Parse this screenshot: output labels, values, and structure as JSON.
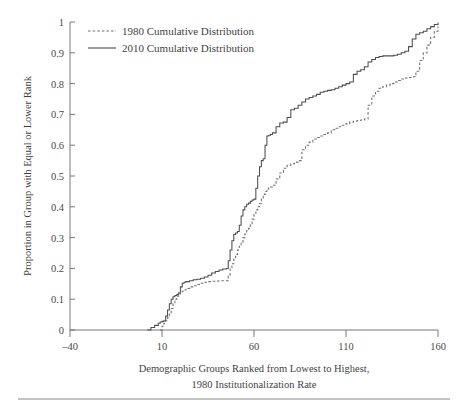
{
  "chart_data": {
    "type": "line",
    "title": "",
    "subtitle": "",
    "xlabel_line1": "Demographic Groups Ranked from Lowest to Highest,",
    "xlabel_line2": "1980 Institutionalization Rate",
    "ylabel": "Proportion in Group with Equal or Lower Rank",
    "xlim": [
      -40,
      160
    ],
    "ylim": [
      0,
      1
    ],
    "xticks": [
      -40,
      10,
      60,
      110,
      160
    ],
    "xticklabels": [
      "–40",
      "10",
      "60",
      "110",
      "160"
    ],
    "yticks": [
      0,
      0.1,
      0.2,
      0.3,
      0.4,
      0.5,
      0.6,
      0.7,
      0.8,
      0.9,
      1
    ],
    "yticklabels": [
      "0",
      "0.1",
      "0.2",
      "0.3",
      "0.4",
      "0.5",
      "0.6",
      "0.7",
      "0.8",
      "0.9",
      "1"
    ],
    "grid": false,
    "legend_position": "top-left-inside",
    "series": [
      {
        "name": "1980 Cumulative Distribution",
        "style": "dashed",
        "color": "#6f6f6f",
        "x": [
          9,
          10,
          11,
          12,
          13,
          14,
          15,
          16,
          17,
          18,
          19,
          20,
          21,
          22,
          23,
          25,
          27,
          29,
          31,
          33,
          35,
          37,
          39,
          41,
          43,
          45,
          46,
          47,
          48,
          49,
          50,
          51,
          52,
          53,
          54,
          55,
          56,
          57,
          58,
          59,
          60,
          61,
          62,
          63,
          64,
          65,
          66,
          67,
          68,
          69,
          70,
          72,
          74,
          76,
          78,
          80,
          82,
          84,
          86,
          88,
          90,
          92,
          94,
          96,
          98,
          100,
          102,
          104,
          106,
          108,
          110,
          112,
          114,
          116,
          118,
          120,
          122,
          124,
          126,
          128,
          130,
          132,
          134,
          136,
          138,
          140,
          142,
          144,
          146,
          148,
          150,
          152,
          154,
          156,
          158,
          160
        ],
        "y": [
          0,
          0.012,
          0.022,
          0.03,
          0.04,
          0.055,
          0.07,
          0.085,
          0.1,
          0.11,
          0.118,
          0.122,
          0.126,
          0.13,
          0.135,
          0.14,
          0.144,
          0.148,
          0.152,
          0.155,
          0.157,
          0.158,
          0.159,
          0.16,
          0.16,
          0.16,
          0.175,
          0.2,
          0.215,
          0.23,
          0.245,
          0.26,
          0.272,
          0.285,
          0.3,
          0.312,
          0.322,
          0.33,
          0.345,
          0.36,
          0.375,
          0.39,
          0.4,
          0.41,
          0.425,
          0.44,
          0.45,
          0.458,
          0.462,
          0.464,
          0.47,
          0.49,
          0.51,
          0.525,
          0.535,
          0.54,
          0.545,
          0.55,
          0.585,
          0.6,
          0.61,
          0.62,
          0.625,
          0.63,
          0.635,
          0.64,
          0.65,
          0.655,
          0.66,
          0.665,
          0.67,
          0.675,
          0.678,
          0.68,
          0.682,
          0.685,
          0.73,
          0.76,
          0.775,
          0.785,
          0.79,
          0.795,
          0.8,
          0.805,
          0.81,
          0.815,
          0.818,
          0.82,
          0.822,
          0.84,
          0.875,
          0.9,
          0.925,
          0.95,
          0.97,
          0.985
        ]
      },
      {
        "name": "2010 Cumulative Distribution",
        "style": "solid",
        "color": "#4d4d4d",
        "x": [
          2,
          4,
          6,
          8,
          9,
          10,
          11,
          12,
          13,
          14,
          15,
          16,
          17,
          18,
          19,
          20,
          21,
          22,
          23,
          25,
          27,
          29,
          31,
          33,
          35,
          37,
          39,
          41,
          43,
          45,
          46,
          47,
          48,
          49,
          50,
          51,
          52,
          53,
          54,
          55,
          56,
          57,
          58,
          59,
          60,
          61,
          62,
          63,
          64,
          65,
          66,
          67,
          68,
          69,
          70,
          72,
          74,
          76,
          78,
          80,
          82,
          84,
          86,
          88,
          90,
          92,
          94,
          96,
          98,
          100,
          102,
          104,
          106,
          108,
          110,
          112,
          114,
          116,
          118,
          120,
          122,
          124,
          126,
          128,
          130,
          132,
          134,
          136,
          138,
          140,
          142,
          144,
          146,
          148,
          150,
          152,
          154,
          156,
          158,
          160
        ],
        "y": [
          0,
          0.008,
          0.015,
          0.022,
          0.026,
          0.028,
          0.03,
          0.045,
          0.065,
          0.085,
          0.1,
          0.108,
          0.112,
          0.115,
          0.12,
          0.14,
          0.152,
          0.155,
          0.157,
          0.16,
          0.163,
          0.165,
          0.168,
          0.172,
          0.178,
          0.185,
          0.19,
          0.195,
          0.198,
          0.2,
          0.225,
          0.26,
          0.29,
          0.31,
          0.315,
          0.32,
          0.34,
          0.37,
          0.39,
          0.4,
          0.408,
          0.412,
          0.418,
          0.422,
          0.425,
          0.46,
          0.5,
          0.53,
          0.55,
          0.556,
          0.6,
          0.63,
          0.632,
          0.635,
          0.64,
          0.66,
          0.672,
          0.675,
          0.69,
          0.715,
          0.72,
          0.73,
          0.74,
          0.75,
          0.755,
          0.76,
          0.765,
          0.772,
          0.775,
          0.778,
          0.78,
          0.785,
          0.79,
          0.795,
          0.8,
          0.805,
          0.83,
          0.84,
          0.845,
          0.855,
          0.87,
          0.878,
          0.885,
          0.888,
          0.89,
          0.89,
          0.89,
          0.892,
          0.895,
          0.9,
          0.905,
          0.92,
          0.945,
          0.96,
          0.965,
          0.97,
          0.978,
          0.985,
          0.992,
          0.998
        ]
      }
    ]
  },
  "legend": {
    "items": [
      {
        "label": "1980 Cumulative Distribution",
        "style": "dashed"
      },
      {
        "label": "2010 Cumulative Distribution",
        "style": "solid"
      }
    ]
  },
  "axes": {
    "y_title": "Proportion in Group with Equal or Lower Rank",
    "x_title_line1": "Demographic Groups Ranked from Lowest to Highest,",
    "x_title_line2": "1980 Institutionalization Rate"
  },
  "ticks": {
    "x": [
      "–40",
      "10",
      "60",
      "110",
      "160"
    ],
    "y": [
      "1",
      "0.9",
      "0.8",
      "0.7",
      "0.6",
      "0.5",
      "0.4",
      "0.3",
      "0.2",
      "0.1",
      "0"
    ]
  },
  "colors": {
    "solid_series": "#4d4d4d",
    "dashed_series": "#6f6f6f",
    "axis": "#6a6a6a",
    "text": "#3f3f3f",
    "background": "#ffffff"
  }
}
